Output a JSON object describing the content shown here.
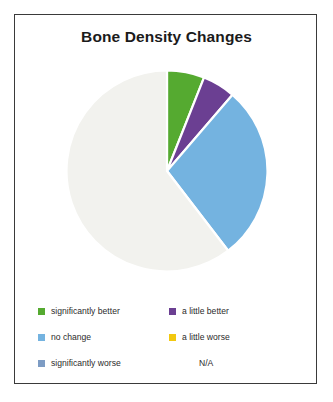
{
  "chart_data": {
    "type": "pie",
    "title": "Bone Density Changes",
    "xlabel": "",
    "ylabel": "",
    "legend_position": "bottom",
    "start_angle_deg": 0,
    "direction": "clockwise",
    "categories": [
      "significantly better",
      "a little better",
      "no change",
      "a little worse",
      "significantly worse",
      "N/A"
    ],
    "values": [
      6.0,
      5.3,
      28.3,
      0,
      0,
      60.4
    ],
    "unit": "percent",
    "slice_angles_deg": [
      21.6,
      19.1,
      101.8,
      0,
      0,
      217.5
    ],
    "colors": [
      "#55aa30",
      "#6b3f92",
      "#74b3e0",
      "#f2c80f",
      "#7d9cc4",
      "#f2f2ee"
    ],
    "slices": [
      {
        "label": "significantly better",
        "value": 6.0,
        "color": "#55aa30",
        "start_deg": 0.0,
        "end_deg": 21.6
      },
      {
        "label": "a little better",
        "value": 5.3,
        "color": "#6b3f92",
        "start_deg": 21.6,
        "end_deg": 40.7
      },
      {
        "label": "no change",
        "value": 28.3,
        "color": "#74b3e0",
        "start_deg": 40.7,
        "end_deg": 142.5
      },
      {
        "label": "a little worse",
        "value": 0,
        "color": "#f2c80f",
        "start_deg": 142.5,
        "end_deg": 142.5
      },
      {
        "label": "significantly worse",
        "value": 0,
        "color": "#7d9cc4",
        "start_deg": 142.5,
        "end_deg": 142.5
      },
      {
        "label": "N/A",
        "value": 60.4,
        "color": "#f2f2ee",
        "start_deg": 142.5,
        "end_deg": 360.0
      }
    ]
  },
  "title": "Bone Density Changes",
  "legend": {
    "rows": [
      [
        {
          "label": "significantly better",
          "color": "#55aa30",
          "show_swatch": true
        },
        {
          "label": "a little better",
          "color": "#6b3f92",
          "show_swatch": true
        }
      ],
      [
        {
          "label": "no change",
          "color": "#74b3e0",
          "show_swatch": true
        },
        {
          "label": "a little worse",
          "color": "#f2c80f",
          "show_swatch": true
        }
      ],
      [
        {
          "label": "significantly worse",
          "color": "#7d9cc4",
          "show_swatch": true
        },
        {
          "label": "N/A",
          "color": "#f2f2ee",
          "show_swatch": false
        }
      ]
    ]
  },
  "colors": {
    "frame": "#3a3a3a",
    "background": "#ffffff",
    "title_text": "#1b1b1b",
    "legend_text": "#2b2b2b",
    "slice_gap": "#ffffff"
  }
}
